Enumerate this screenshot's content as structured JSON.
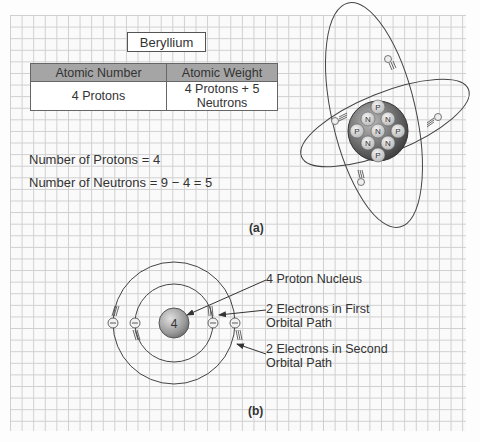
{
  "figure_a": {
    "element_name": "Beryllium",
    "table": {
      "headers": [
        "Atomic Number",
        "Atomic Weight"
      ],
      "rows": [
        [
          "4 Protons",
          "4 Protons + 5 Neutrons"
        ]
      ]
    },
    "equations": [
      "Number of Protons = 4",
      "Number of Neutrons = 9 − 4 = 5"
    ],
    "label": "(a)",
    "nucleus_particles": [
      "P",
      "N",
      "N",
      "P",
      "N",
      "P",
      "N",
      "N",
      "P"
    ],
    "electron_symbol": "e"
  },
  "figure_b": {
    "nucleus_label": "4",
    "electron_symbol": "−",
    "callouts": {
      "nucleus": "4 Proton Nucleus",
      "first_orbit_line1": "2 Electrons in First",
      "first_orbit_line2": "Orbital Path",
      "second_orbit_line1": "2 Electrons in Second",
      "second_orbit_line2": "Orbital Path"
    },
    "label": "(b)"
  },
  "colors": {
    "grid": "#cfcfcf",
    "table_header": "#a5a5a5",
    "nucleus_sphere": "#777777",
    "particle": "#dddddd",
    "line": "#444444"
  }
}
